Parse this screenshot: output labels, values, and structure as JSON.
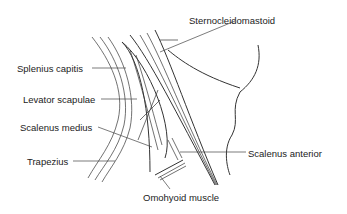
{
  "figure": {
    "labels": [
      {
        "id": "sternocleidomastoid",
        "text": "Sternocleidomastoid",
        "x": 189,
        "y": 16
      },
      {
        "id": "splenius-capitis",
        "text": "Splenius capitis",
        "x": 17,
        "y": 64
      },
      {
        "id": "levator-scapulae",
        "text": "Levator scapulae",
        "x": 23,
        "y": 95
      },
      {
        "id": "scalenus-medius",
        "text": "Scalenus medius",
        "x": 20,
        "y": 123
      },
      {
        "id": "trapezius",
        "text": "Trapezius",
        "x": 27,
        "y": 157
      },
      {
        "id": "scalenus-anterior",
        "text": "Scalenus anterior",
        "x": 248,
        "y": 149
      },
      {
        "id": "omohyoid-muscle",
        "text": "Omohyoid muscle",
        "x": 143,
        "y": 193
      }
    ]
  }
}
